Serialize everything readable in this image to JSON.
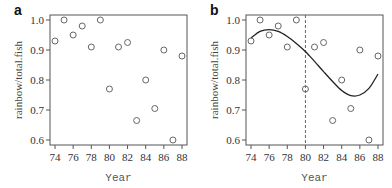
{
  "chart_data": [
    {
      "type": "scatter",
      "panel_label": "a",
      "title": "",
      "xlabel": "Year",
      "ylabel": "rainbow/total.fish",
      "xlim": [
        74,
        88
      ],
      "ylim": [
        0.6,
        1.0
      ],
      "xticks": [
        74,
        76,
        78,
        80,
        82,
        84,
        86,
        88
      ],
      "yticks": [
        0.6,
        0.7,
        0.8,
        0.9,
        1.0
      ],
      "ytick_labels": [
        "0.6",
        "0.7",
        "0.8",
        "0.9",
        "1.0"
      ],
      "grid": false,
      "marker": "open-circle",
      "x": [
        74,
        75,
        76,
        77,
        78,
        79,
        80,
        81,
        82,
        83,
        84,
        85,
        86,
        87,
        88
      ],
      "y": [
        0.93,
        1.0,
        0.95,
        0.98,
        0.91,
        1.0,
        0.77,
        0.91,
        0.925,
        0.665,
        0.8,
        0.705,
        0.9,
        0.6,
        0.88
      ]
    },
    {
      "type": "scatter",
      "panel_label": "b",
      "title": "",
      "xlabel": "Year",
      "ylabel": "rainbow/total.fish",
      "xlim": [
        74,
        88
      ],
      "ylim": [
        0.6,
        1.0
      ],
      "xticks": [
        74,
        76,
        78,
        80,
        82,
        84,
        86,
        88
      ],
      "yticks": [
        0.6,
        0.7,
        0.8,
        0.9,
        1.0
      ],
      "ytick_labels": [
        "0.6",
        "0.7",
        "0.8",
        "0.9",
        "1.0"
      ],
      "grid": false,
      "marker": "open-circle",
      "x": [
        74,
        75,
        76,
        77,
        78,
        79,
        80,
        81,
        82,
        83,
        84,
        85,
        86,
        87,
        88
      ],
      "y": [
        0.93,
        1.0,
        0.95,
        0.98,
        0.91,
        1.0,
        0.77,
        0.91,
        0.925,
        0.665,
        0.8,
        0.705,
        0.9,
        0.6,
        0.88
      ],
      "annotations": [
        {
          "type": "vline",
          "x": 80,
          "style": "dashed"
        }
      ],
      "fitted_curve": {
        "name": "smooth fit",
        "x": [
          74,
          75,
          76,
          77,
          78,
          79,
          80,
          81,
          82,
          83,
          84,
          85,
          86,
          87,
          88
        ],
        "y": [
          0.94,
          0.962,
          0.968,
          0.962,
          0.945,
          0.922,
          0.895,
          0.862,
          0.828,
          0.795,
          0.765,
          0.748,
          0.75,
          0.772,
          0.82
        ]
      }
    }
  ]
}
